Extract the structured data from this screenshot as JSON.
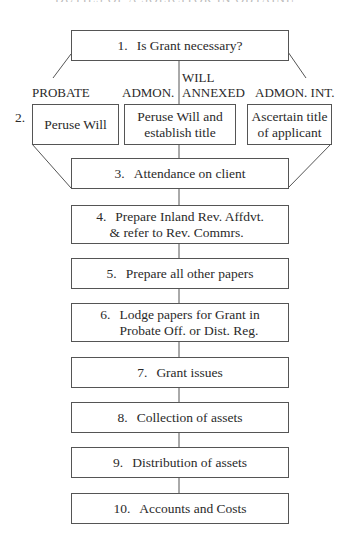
{
  "header_fragment": "DUTIES OF A SOLICITOR IN OBTAINING A GRANT",
  "steps": {
    "s1": {
      "num": "1.",
      "text": "Is Grant necessary?"
    },
    "s2_num": "2.",
    "s2a": {
      "text": "Peruse Will"
    },
    "s2b": {
      "line1": "Peruse Will and",
      "line2": "establish title"
    },
    "s2c": {
      "line1": "Ascertain title",
      "line2": "of applicant"
    },
    "s3": {
      "num": "3.",
      "text": "Attendance on client"
    },
    "s4": {
      "num": "4.",
      "line1": "Prepare Inland Rev. Affdvt.",
      "line2": "& refer to Rev. Commrs."
    },
    "s5": {
      "num": "5.",
      "text": "Prepare all other papers"
    },
    "s6": {
      "num": "6.",
      "line1": "Lodge papers for Grant in",
      "line2": "Probate Off. or Dist. Reg."
    },
    "s7": {
      "num": "7.",
      "text": "Grant issues"
    },
    "s8": {
      "num": "8.",
      "text": "Collection of assets"
    },
    "s9": {
      "num": "9.",
      "text": "Distribution of assets"
    },
    "s10": {
      "num": "10.",
      "text": "Accounts and Costs"
    }
  },
  "branch_labels": {
    "probate": "PROBATE",
    "admon": "ADMON.",
    "will": "WILL",
    "annexed": "ANNEXED",
    "admon_int": "ADMON. INT."
  },
  "colors": {
    "line": "#555555",
    "text": "#2a2a2a",
    "background": "#ffffff"
  }
}
